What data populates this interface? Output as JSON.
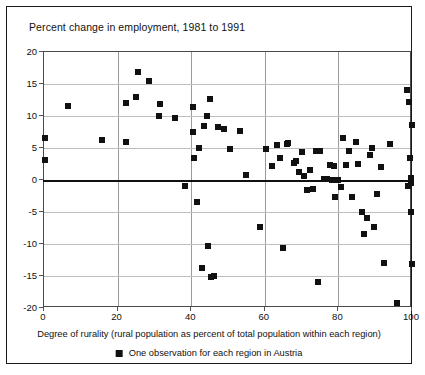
{
  "chart_data": {
    "type": "scatter",
    "title": "Percent change in employment, 1981 to 1991",
    "xlabel": "Degree of rurality (rural population as percent of total population within each region)",
    "ylabel": "Percent change in employment, 1981 to 1991",
    "legend": [
      {
        "marker": "black-square",
        "label": "One observation for each region in Austria"
      }
    ],
    "legend_position": "below-axis",
    "grid": true,
    "xlim": [
      0,
      100
    ],
    "ylim": [
      -20,
      20
    ],
    "xticks": [
      0,
      20,
      40,
      60,
      80,
      100
    ],
    "yticks": [
      20,
      15,
      10,
      5,
      0,
      -5,
      -10,
      -15,
      -20
    ],
    "series": [
      {
        "name": "Austrian regions",
        "color": "#111111",
        "points": [
          [
            0.3,
            6.6
          ],
          [
            0.3,
            3.2
          ],
          [
            6.5,
            11.6
          ],
          [
            15.8,
            6.2
          ],
          [
            22.2,
            12.1
          ],
          [
            22.4,
            5.9
          ],
          [
            25.0,
            13.0
          ],
          [
            25.6,
            16.8
          ],
          [
            28.4,
            15.4
          ],
          [
            31.2,
            10.0
          ],
          [
            31.4,
            11.8
          ],
          [
            35.6,
            9.7
          ],
          [
            38.4,
            -1.0
          ],
          [
            40.4,
            11.4
          ],
          [
            40.6,
            7.5
          ],
          [
            40.8,
            3.5
          ],
          [
            41.6,
            -3.4
          ],
          [
            42.0,
            5.0
          ],
          [
            43.0,
            -13.8
          ],
          [
            43.6,
            8.4
          ],
          [
            44.2,
            10.0
          ],
          [
            44.6,
            -10.3
          ],
          [
            45.2,
            12.6
          ],
          [
            45.4,
            -15.2
          ],
          [
            46.2,
            -15.0
          ],
          [
            47.2,
            8.3
          ],
          [
            49.0,
            8.0
          ],
          [
            50.6,
            4.8
          ],
          [
            53.2,
            7.6
          ],
          [
            55.0,
            0.8
          ],
          [
            58.8,
            -7.3
          ],
          [
            60.2,
            4.9
          ],
          [
            62.0,
            2.2
          ],
          [
            63.4,
            5.4
          ],
          [
            64.2,
            3.4
          ],
          [
            65.0,
            -10.6
          ],
          [
            66.0,
            5.6
          ],
          [
            66.4,
            5.8
          ],
          [
            67.8,
            2.6
          ],
          [
            68.6,
            3.0
          ],
          [
            69.2,
            1.2
          ],
          [
            70.2,
            4.4
          ],
          [
            70.6,
            0.6
          ],
          [
            71.6,
            -1.6
          ],
          [
            72.4,
            1.6
          ],
          [
            73.0,
            -1.4
          ],
          [
            73.8,
            4.6
          ],
          [
            74.4,
            -16.0
          ],
          [
            75.0,
            4.6
          ],
          [
            76.2,
            0.1
          ],
          [
            77.0,
            0.1
          ],
          [
            77.6,
            2.4
          ],
          [
            78.2,
            0.0
          ],
          [
            78.8,
            2.2
          ],
          [
            79.0,
            -2.6
          ],
          [
            79.8,
            0.0
          ],
          [
            80.6,
            -1.1
          ],
          [
            81.2,
            6.5
          ],
          [
            82.2,
            2.3
          ],
          [
            83.0,
            4.6
          ],
          [
            83.6,
            -2.6
          ],
          [
            84.8,
            6.0
          ],
          [
            85.2,
            2.5
          ],
          [
            86.4,
            -5.0
          ],
          [
            87.0,
            -8.4
          ],
          [
            87.8,
            -6.0
          ],
          [
            88.6,
            3.9
          ],
          [
            89.2,
            5.0
          ],
          [
            89.8,
            -7.4
          ],
          [
            90.6,
            -2.2
          ],
          [
            91.6,
            2.1
          ],
          [
            92.4,
            -13.0
          ],
          [
            94.0,
            5.6
          ],
          [
            95.8,
            -19.2
          ],
          [
            98.6,
            14.1
          ],
          [
            99.0,
            -1.0
          ],
          [
            99.2,
            12.2
          ],
          [
            99.4,
            3.4
          ],
          [
            99.6,
            0.3
          ],
          [
            99.6,
            -0.4
          ],
          [
            99.8,
            -5.0
          ],
          [
            99.9,
            -13.2
          ],
          [
            99.9,
            8.6
          ]
        ]
      }
    ]
  }
}
